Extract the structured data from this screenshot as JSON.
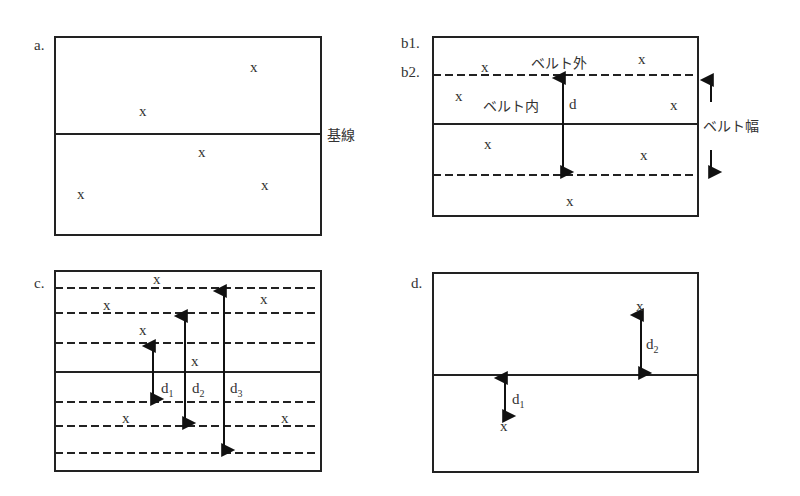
{
  "panels": {
    "a": {
      "label": "a.",
      "baseline_label": "基線",
      "points": [
        [
          258,
          68
        ],
        [
          143,
          112
        ],
        [
          203,
          154
        ],
        [
          82,
          196
        ],
        [
          265,
          187
        ]
      ]
    },
    "b": {
      "label1": "b1.",
      "label2": "b2.",
      "outside_label": "ベルト外",
      "inside_label": "ベルト内",
      "distance_label": "d",
      "width_label": "ベルト幅",
      "points": [
        [
          485,
          68
        ],
        [
          643,
          61
        ],
        [
          460,
          98
        ],
        [
          675,
          107
        ],
        [
          489,
          146
        ],
        [
          645,
          157
        ],
        [
          570,
          203
        ]
      ]
    },
    "c": {
      "label": "c.",
      "d1": "d",
      "d1_sub": "1",
      "d2": "d",
      "d2_sub": "2",
      "d3": "d",
      "d3_sub": "3",
      "points": [
        [
          158,
          280
        ],
        [
          108,
          306
        ],
        [
          144,
          332
        ],
        [
          196,
          363
        ],
        [
          265,
          300
        ],
        [
          127,
          420
        ],
        [
          286,
          420
        ]
      ]
    },
    "d": {
      "label": "d.",
      "d1": "d",
      "d1_sub": "1",
      "d2": "d",
      "d2_sub": "2",
      "points": [
        [
          641,
          307
        ],
        [
          505,
          428
        ]
      ]
    },
    "marker": "x"
  }
}
